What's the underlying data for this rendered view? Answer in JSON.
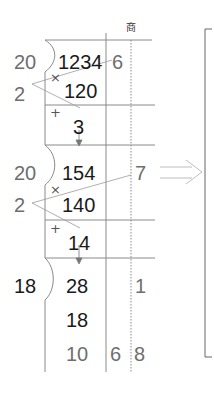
{
  "header": {
    "quotient_label": "商"
  },
  "steps": [
    {
      "divisor": "20",
      "multiplier": "2",
      "dividend": "1234",
      "product": "120",
      "remainder": "3",
      "quotient_digit": "6"
    },
    {
      "divisor": "20",
      "multiplier": "2",
      "dividend": "154",
      "product": "140",
      "remainder": "14",
      "quotient_digit": "7"
    },
    {
      "divisor": "18",
      "dividend": "28",
      "product": "18",
      "remainder": "10",
      "quotient_digit": "1"
    }
  ],
  "final": {
    "remainder": "10",
    "quotient_left": "6",
    "quotient_right": "8"
  },
  "symbols": {
    "times": "×",
    "plus": "+"
  },
  "colors": {
    "line": "#888888",
    "text_dark": "#1a1a1a",
    "text_gray": "#6e6e6e",
    "arrow": "#bdbdbd"
  }
}
